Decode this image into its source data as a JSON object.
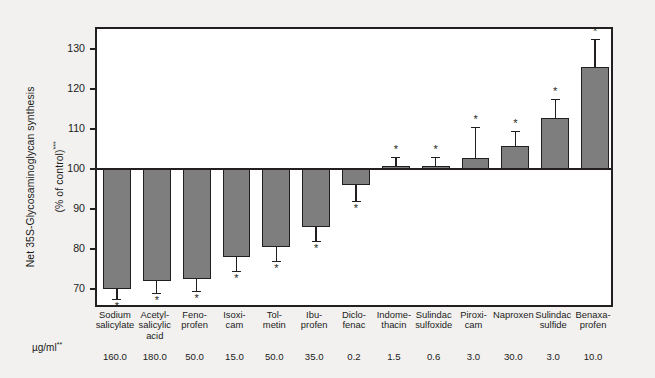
{
  "chart_data": {
    "type": "bar",
    "title": "",
    "xlabel": "",
    "ylabel": "Net 35S-Glycosaminoglycan synthesis\n(% of control)***",
    "ylabel_main": "Net 35S-Glycosaminoglycan synthesis",
    "ylabel_sub": "(% of control)",
    "ylabel_sup": "***",
    "dose_label": "µg/ml",
    "dose_label_sup": "**",
    "ylim": [
      65,
      135
    ],
    "yticks": [
      70,
      80,
      90,
      100,
      110,
      120,
      130
    ],
    "ytick_labels": [
      "70",
      "80",
      "90",
      "100",
      "110",
      "120",
      "130"
    ],
    "baseline": 100,
    "grid": false,
    "legend": null,
    "significance_marker": "*",
    "categories": [
      "Sodium\nsalicylate",
      "Acetyl-\nsalicylic\nacid",
      "Feno-\nprofen",
      "Isoxi-\ncam",
      "Tol-\nmetin",
      "Ibu-\nprofen",
      "Diclo-\nfenac",
      "Indome-\nthacin",
      "Sulindac\nsulfoxide",
      "Piroxi-\ncam",
      "Naproxen",
      "Sulindac\nsulfide",
      "Benaxa-\nprofen"
    ],
    "doses": [
      "160.0",
      "180.0",
      "50.0",
      "15.0",
      "50.0",
      "35.0",
      "0.2",
      "1.5",
      "0.6",
      "3.0",
      "30.0",
      "3.0",
      "10.0"
    ],
    "values": [
      70.0,
      72.0,
      72.5,
      78.0,
      80.5,
      85.5,
      96.0,
      100.8,
      100.8,
      102.8,
      105.8,
      112.8,
      125.5
    ],
    "error_outer": [
      67.5,
      69.0,
      69.5,
      74.5,
      77.0,
      82.0,
      92.0,
      103.0,
      103.0,
      110.5,
      109.5,
      117.5,
      132.5
    ],
    "starred": [
      true,
      true,
      true,
      true,
      true,
      true,
      true,
      true,
      true,
      true,
      true,
      true,
      true
    ],
    "bar_color": "#7e7e7e",
    "bar_edge_color": "#231f20",
    "axis_color": "#231f20",
    "plot_bg": "#ffffff",
    "figure_bg": "#f2f1ef"
  }
}
